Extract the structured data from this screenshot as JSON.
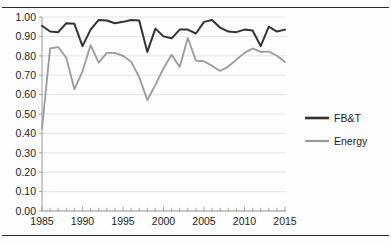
{
  "figure": {
    "top_rule": "horizontal-rule",
    "bottom_rule": "horizontal-rule"
  },
  "chart_data": {
    "type": "line",
    "title": "",
    "subtitle": "",
    "xlabel": "",
    "ylabel": "",
    "xlim": [
      1985,
      2015
    ],
    "ylim": [
      0.0,
      1.0
    ],
    "grid": true,
    "legend_position": "right",
    "y_ticks": [
      "1.00",
      "0.90",
      "0.80",
      "0.70",
      "0.60",
      "0.50",
      "0.40",
      "0.30",
      "0.20",
      "0.10",
      "0.00"
    ],
    "y_tick_values": [
      1.0,
      0.9,
      0.8,
      0.7,
      0.6,
      0.5,
      0.4,
      0.3,
      0.2,
      0.1,
      0.0
    ],
    "x_ticks": [
      "1985",
      "1990",
      "1995",
      "2000",
      "2005",
      "2010",
      "2015"
    ],
    "x_tick_values": [
      1985,
      1990,
      1995,
      2000,
      2005,
      2010,
      2015
    ],
    "x_minor_tick_values": [
      1985,
      1986,
      1987,
      1988,
      1989,
      1990,
      1991,
      1992,
      1993,
      1994,
      1995,
      1996,
      1997,
      1998,
      1999,
      2000,
      2001,
      2002,
      2003,
      2004,
      2005,
      2006,
      2007,
      2008,
      2009,
      2010,
      2011,
      2012,
      2013,
      2014,
      2015
    ],
    "x": [
      1985,
      1986,
      1987,
      1988,
      1989,
      1990,
      1991,
      1992,
      1993,
      1994,
      1995,
      1996,
      1997,
      1998,
      1999,
      2000,
      2001,
      2002,
      2003,
      2004,
      2005,
      2006,
      2007,
      2008,
      2009,
      2010,
      2011,
      2012,
      2013,
      2014,
      2015
    ],
    "series": [
      {
        "name": "FB&T",
        "color": "#333333",
        "width": 2.0,
        "values": [
          0.955,
          0.925,
          0.922,
          0.968,
          0.965,
          0.85,
          0.935,
          0.985,
          0.982,
          0.968,
          0.975,
          0.985,
          0.982,
          0.82,
          0.94,
          0.9,
          0.89,
          0.935,
          0.935,
          0.915,
          0.975,
          0.985,
          0.945,
          0.925,
          0.922,
          0.935,
          0.93,
          0.85,
          0.95,
          0.925,
          0.935
        ]
      },
      {
        "name": "Energy",
        "color": "#9b9b9b",
        "width": 1.8,
        "values": [
          0.425,
          0.838,
          0.845,
          0.79,
          0.628,
          0.72,
          0.855,
          0.765,
          0.815,
          0.815,
          0.8,
          0.77,
          0.69,
          0.572,
          0.65,
          0.735,
          0.805,
          0.742,
          0.892,
          0.775,
          0.772,
          0.748,
          0.722,
          0.745,
          0.78,
          0.815,
          0.838,
          0.82,
          0.822,
          0.8,
          0.768
        ]
      }
    ],
    "legend": [
      {
        "label": "FB&T",
        "color": "#333333",
        "width": 2.6
      },
      {
        "label": "Energy",
        "color": "#9b9b9b",
        "width": 2.2
      }
    ]
  }
}
